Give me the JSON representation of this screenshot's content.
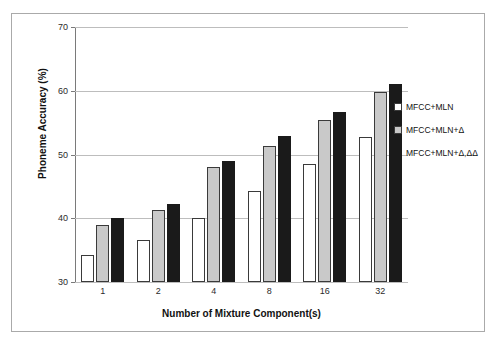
{
  "chart_data": {
    "type": "bar",
    "title": "",
    "xlabel": "Number of Mixture Component(s)",
    "ylabel": "Phoneme Accuracy (%)",
    "categories": [
      "1",
      "2",
      "4",
      "8",
      "16",
      "32"
    ],
    "ylim": [
      30,
      70
    ],
    "yticks": [
      30,
      40,
      50,
      60,
      70
    ],
    "grid": true,
    "legend_position": "right",
    "series": [
      {
        "name": "MFCC+MLN",
        "color": "#ffffff",
        "values": [
          34.3,
          36.6,
          40.0,
          44.2,
          48.5,
          52.8
        ]
      },
      {
        "name": "MFCC+MLN+Δ",
        "color": "#c9c9c9",
        "values": [
          38.9,
          41.3,
          48.0,
          51.3,
          55.4,
          59.8
        ]
      },
      {
        "name": "MFCC+MLN+Δ,ΔΔ",
        "color": "#1a1a1a",
        "values": [
          40.0,
          42.2,
          49.0,
          52.9,
          56.7,
          61.0
        ]
      }
    ]
  },
  "legend": {
    "items": [
      {
        "label": "MFCC+MLN"
      },
      {
        "label": "MFCC+MLN+Δ"
      },
      {
        "label": "MFCC+MLN+Δ,ΔΔ"
      }
    ]
  },
  "axes": {
    "y_tick_labels": [
      "70",
      "60",
      "50",
      "40",
      "30"
    ],
    "x_tick_labels": [
      "1",
      "2",
      "4",
      "8",
      "16",
      "32"
    ],
    "y_axis_title": "Phoneme Accuracy (%)",
    "x_axis_title": "Number of Mixture Component(s)"
  }
}
